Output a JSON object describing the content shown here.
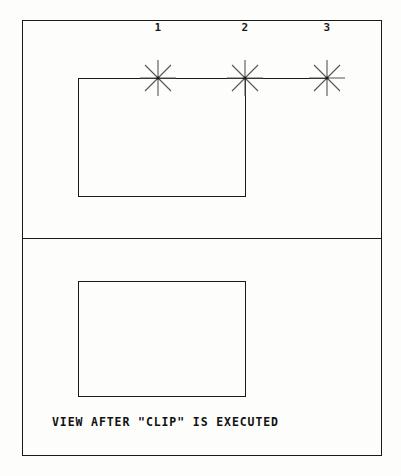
{
  "figure": {
    "background_color": "#fdfdfb",
    "line_color": "#1a1a1a",
    "caption": "VIEW AFTER \"CLIP\" IS EXECUTED"
  },
  "panels": [
    {
      "name": "before-clip",
      "shape_label": "rectangle",
      "markers": [
        {
          "label": "1",
          "x": 158,
          "y": 78
        },
        {
          "label": "2",
          "x": 245,
          "y": 78
        },
        {
          "label": "3",
          "x": 327,
          "y": 78
        }
      ]
    },
    {
      "name": "after-clip",
      "shape_label": "rectangle",
      "markers": []
    }
  ],
  "markers": {
    "m1": "1",
    "m2": "2",
    "m3": "3"
  }
}
